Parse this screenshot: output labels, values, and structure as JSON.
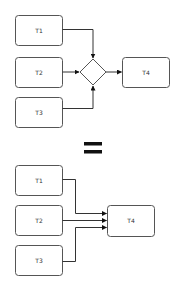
{
  "top_diagram": {
    "nodes": [
      {
        "id": "T1",
        "label": "T1"
      },
      {
        "id": "T2",
        "label": "T2"
      },
      {
        "id": "T3",
        "label": "T3"
      },
      {
        "id": "T4",
        "label": "T4"
      }
    ],
    "gateway": {
      "shape": "diamond"
    },
    "edges": [
      {
        "from": "T1",
        "to": "gateway"
      },
      {
        "from": "T2",
        "to": "gateway"
      },
      {
        "from": "T3",
        "to": "gateway"
      },
      {
        "from": "gateway",
        "to": "T4"
      }
    ]
  },
  "separator": {
    "symbol": "="
  },
  "bottom_diagram": {
    "nodes": [
      {
        "id": "T1",
        "label": "T1"
      },
      {
        "id": "T2",
        "label": "T2"
      },
      {
        "id": "T3",
        "label": "T3"
      },
      {
        "id": "T4",
        "label": "T4"
      }
    ],
    "edges": [
      {
        "from": "T1",
        "to": "T4"
      },
      {
        "from": "T2",
        "to": "T4"
      },
      {
        "from": "T3",
        "to": "T4"
      }
    ]
  },
  "colors": {
    "stroke": "#555555",
    "arrow": "#333333",
    "text": "#333333"
  }
}
